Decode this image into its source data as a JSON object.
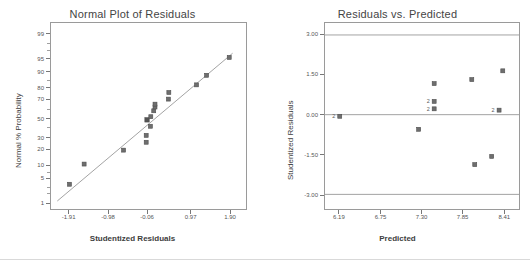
{
  "figure": {
    "background": "#ffffff",
    "marker_color": "#6e6e6e",
    "line_color": "#8a8a8a",
    "axis_color": "#9a9a9a",
    "text_color": "#444444"
  },
  "chart_data": [
    {
      "type": "scatter",
      "name": "normal-plot-of-residuals",
      "title": "Normal Plot of Residuals",
      "xlabel": "Studentized Residuals",
      "ylabel": "Normal % Probability",
      "xlim": [
        -2.35,
        2.3
      ],
      "ylim_percent": [
        0.6,
        99.6
      ],
      "grid": false,
      "legend": null,
      "xticks": [
        "-1.91",
        "-0.98",
        "-0.06",
        "0.97",
        "1.90"
      ],
      "xtick_values": [
        -1.91,
        -0.98,
        -0.06,
        0.97,
        1.9
      ],
      "yticks": [
        "99",
        "95",
        "90",
        "80",
        "70",
        "50",
        "30",
        "20",
        "10",
        "5",
        "1"
      ],
      "ytick_values": [
        99,
        95,
        90,
        80,
        70,
        50,
        30,
        20,
        10,
        5,
        1
      ],
      "reference_line": {
        "x": [
          -2.2,
          1.98
        ],
        "y_percent": [
          1.1,
          96.5
        ]
      },
      "points": [
        {
          "x": -1.91,
          "p": 3.4,
          "highlight": false
        },
        {
          "x": -1.56,
          "p": 10.3,
          "highlight": false
        },
        {
          "x": -0.62,
          "p": 19.0,
          "highlight": false
        },
        {
          "x": -0.08,
          "p": 25.5,
          "highlight": false
        },
        {
          "x": -0.08,
          "p": 32.0,
          "highlight": false
        },
        {
          "x": -0.06,
          "p": 48.5,
          "highlight": true
        },
        {
          "x": 0.02,
          "p": 41.5,
          "highlight": false
        },
        {
          "x": 0.03,
          "p": 52.0,
          "highlight": false
        },
        {
          "x": 0.1,
          "p": 58.5,
          "highlight": false
        },
        {
          "x": 0.13,
          "p": 62.5,
          "highlight": false
        },
        {
          "x": 0.13,
          "p": 65.5,
          "highlight": false
        },
        {
          "x": 0.45,
          "p": 70.5,
          "highlight": false
        },
        {
          "x": 0.46,
          "p": 76.5,
          "highlight": false
        },
        {
          "x": 1.12,
          "p": 82.5,
          "highlight": false
        },
        {
          "x": 1.36,
          "p": 88.5,
          "highlight": false
        },
        {
          "x": 1.9,
          "p": 95.5,
          "highlight": false
        }
      ]
    },
    {
      "type": "scatter",
      "name": "residuals-vs-predicted",
      "title": "Residuals vs. Predicted",
      "xlabel": "Predicted",
      "ylabel": "Studentized Residuals",
      "xlim": [
        5.99,
        8.62
      ],
      "ylim": [
        -3.55,
        3.45
      ],
      "grid": false,
      "legend": null,
      "xticks": [
        "6.19",
        "6.75",
        "7.30",
        "7.85",
        "8.41"
      ],
      "xtick_values": [
        6.19,
        6.75,
        7.3,
        7.85,
        8.41
      ],
      "yticks": [
        "3.00",
        "1.50",
        "0.00",
        "-1.50",
        "-3.00"
      ],
      "ytick_values": [
        3.0,
        1.5,
        0.0,
        -1.5,
        -3.0
      ],
      "hlines": [
        3.0,
        0.0,
        -3.0
      ],
      "points": [
        {
          "x": 6.19,
          "y": -0.06,
          "label": "2"
        },
        {
          "x": 7.26,
          "y": -0.55,
          "label": ""
        },
        {
          "x": 7.47,
          "y": 1.17,
          "label": ""
        },
        {
          "x": 7.47,
          "y": 0.5,
          "label": "2"
        },
        {
          "x": 7.47,
          "y": 0.22,
          "label": "2"
        },
        {
          "x": 7.98,
          "y": 1.32,
          "label": ""
        },
        {
          "x": 8.02,
          "y": -1.88,
          "label": ""
        },
        {
          "x": 8.25,
          "y": -1.57,
          "label": ""
        },
        {
          "x": 8.35,
          "y": 0.17,
          "label": "2"
        },
        {
          "x": 8.4,
          "y": 1.65,
          "label": ""
        }
      ]
    }
  ]
}
